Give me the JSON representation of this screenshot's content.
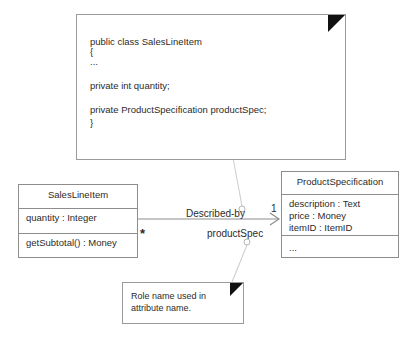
{
  "diagram": {
    "type": "uml-class-diagram"
  },
  "code_note": {
    "name": "code-note",
    "lines": [
      "public class SalesLineItem",
      "{",
      "...",
      "",
      "private int quantity;",
      "",
      "private ProductSpecification productSpec;",
      "}"
    ]
  },
  "role_note": {
    "name": "role-name-note",
    "text": "Role name used in attribute name."
  },
  "classes": [
    {
      "name": "SalesLineItem",
      "attributes": [
        "quantity : Integer"
      ],
      "operations": [
        "getSubtotal() : Money"
      ]
    },
    {
      "name": "ProductSpecification",
      "attributes": [
        "description : Text",
        "price : Money",
        "itemID : ItemID"
      ],
      "operations": [
        "..."
      ]
    }
  ],
  "association": {
    "label": "Described-by",
    "role_name": "productSpec",
    "source_multiplicity": "*",
    "target_multiplicity": "1",
    "navigable": true
  },
  "colors": {
    "stroke": "#8d8d8d",
    "note_stroke": "#9a9a9a",
    "fold": "#111111",
    "leader": "#cfcfcf",
    "text": "#2b2b2b",
    "background": "#ffffff"
  }
}
